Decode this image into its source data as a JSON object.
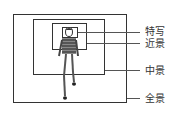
{
  "diagram": {
    "type": "shot-size-framing",
    "labels": [
      {
        "id": "closeup",
        "text": "特写"
      },
      {
        "id": "medium-close",
        "text": "近景"
      },
      {
        "id": "medium",
        "text": "中景"
      },
      {
        "id": "full",
        "text": "全景"
      }
    ]
  }
}
